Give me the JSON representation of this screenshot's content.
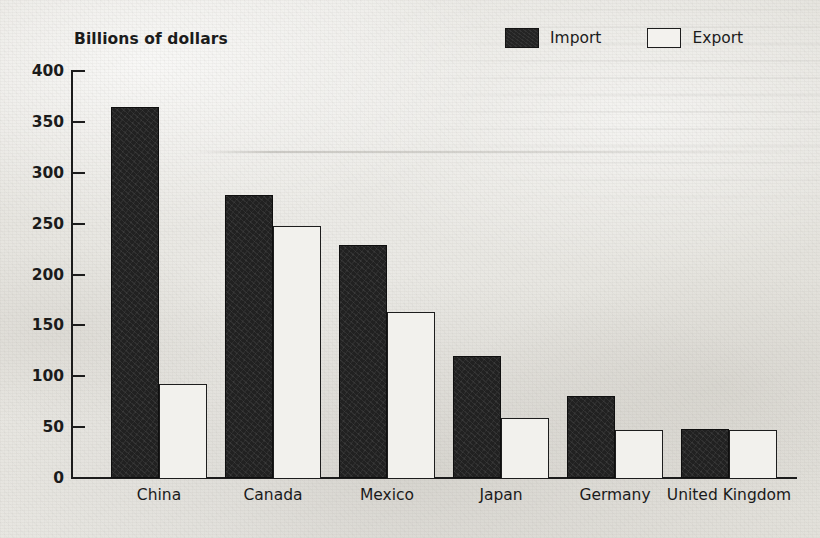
{
  "chart_data": {
    "type": "bar",
    "title": "",
    "axis_title": "Billions of dollars",
    "xlabel": "",
    "ylabel": "Billions of dollars",
    "ylim": [
      0,
      400
    ],
    "ytick_step": 50,
    "yticks": [
      0,
      50,
      100,
      150,
      200,
      250,
      300,
      350,
      400
    ],
    "ytick_labels": [
      "0",
      "50",
      "100",
      "150",
      "200",
      "250",
      "300",
      "350",
      "400"
    ],
    "grid": false,
    "legend_position": "top-right",
    "categories": [
      "China",
      "Canada",
      "Mexico",
      "Japan",
      "Germany",
      "United Kingdom"
    ],
    "series": [
      {
        "name": "Import",
        "color": "#212121",
        "style": "filled",
        "values": [
          365,
          278,
          229,
          120,
          81,
          48
        ]
      },
      {
        "name": "Export",
        "color": "#f2f1ed",
        "style": "outlined",
        "values": [
          92,
          248,
          163,
          59,
          47,
          47
        ]
      }
    ],
    "units": "billions of dollars",
    "annotations": []
  },
  "legend": {
    "items": [
      {
        "label": "Import",
        "swatch": "filled-square-icon"
      },
      {
        "label": "Export",
        "swatch": "hollow-square-icon"
      }
    ]
  },
  "axis": {
    "y_title": "Billions of dollars"
  }
}
